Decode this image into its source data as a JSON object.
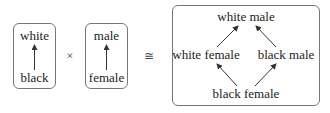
{
  "factor1": {
    "top": "white",
    "bottom": "black"
  },
  "operator_product": "×",
  "factor2": {
    "top": "male",
    "bottom": "female"
  },
  "operator_iso": "≅",
  "product": {
    "top": "white male",
    "left": "white female",
    "right": "black male",
    "bottom": "black female"
  },
  "edges": [
    {
      "from": "black",
      "to": "white"
    },
    {
      "from": "female",
      "to": "male"
    },
    {
      "from": "black female",
      "to": "white female"
    },
    {
      "from": "black female",
      "to": "black male"
    },
    {
      "from": "white female",
      "to": "white male"
    },
    {
      "from": "black male",
      "to": "white male"
    }
  ]
}
